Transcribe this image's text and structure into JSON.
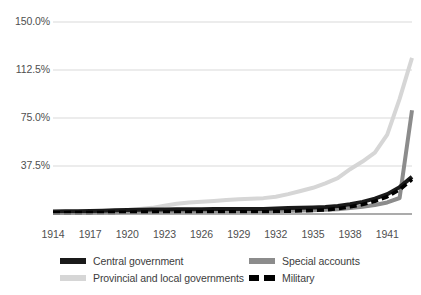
{
  "chart_data": {
    "type": "line",
    "title": "",
    "subtitle": "",
    "xlabel": "",
    "ylabel": "",
    "xlim": [
      1914,
      1943
    ],
    "ylim": [
      0,
      150
    ],
    "grid": true,
    "legend_position": "bottom",
    "y_ticks": [
      "150.0%",
      "112.5%",
      "75.0%",
      "37.5%"
    ],
    "y_tick_values": [
      150.0,
      112.5,
      75.0,
      37.5
    ],
    "x_ticks": [
      "1914",
      "1917",
      "1920",
      "1923",
      "1926",
      "1929",
      "1932",
      "1935",
      "1938",
      "1941"
    ],
    "x_tick_values": [
      1914,
      1917,
      1920,
      1923,
      1926,
      1929,
      1932,
      1935,
      1938,
      1941
    ],
    "x": [
      1914,
      1915,
      1916,
      1917,
      1918,
      1919,
      1920,
      1921,
      1922,
      1923,
      1924,
      1925,
      1926,
      1927,
      1928,
      1929,
      1930,
      1931,
      1932,
      1933,
      1934,
      1935,
      1936,
      1937,
      1938,
      1939,
      1940,
      1941,
      1942,
      1943
    ],
    "series": [
      {
        "name": "Central government",
        "color": "#1a1a1a",
        "style": "solid",
        "values": [
          2.0,
          2.1,
          2.2,
          2.4,
          2.6,
          2.9,
          3.2,
          3.4,
          3.5,
          3.6,
          3.7,
          3.7,
          3.8,
          3.9,
          4.0,
          4.0,
          3.9,
          3.9,
          4.2,
          4.6,
          4.8,
          5.0,
          5.4,
          6.2,
          7.6,
          9.5,
          12.0,
          15.5,
          21.0,
          29.0
        ]
      },
      {
        "name": "Special accounts",
        "color": "#8c8c8c",
        "style": "solid",
        "values": [
          1.0,
          1.0,
          1.1,
          1.2,
          1.3,
          1.4,
          1.6,
          1.7,
          1.8,
          1.9,
          1.9,
          2.0,
          2.0,
          2.1,
          2.1,
          2.2,
          2.2,
          2.2,
          2.4,
          2.6,
          2.8,
          3.0,
          3.3,
          3.8,
          4.6,
          5.6,
          7.0,
          9.0,
          12.5,
          81.0
        ]
      },
      {
        "name": "Provincial and local governments",
        "color": "#d6d6d6",
        "style": "solid",
        "values": [
          1.5,
          1.6,
          1.7,
          1.9,
          2.2,
          2.6,
          3.2,
          4.0,
          4.8,
          6.5,
          8.0,
          9.0,
          9.6,
          10.2,
          11.0,
          11.6,
          12.0,
          12.4,
          13.5,
          15.5,
          18.0,
          20.5,
          24.0,
          28.0,
          35.0,
          41.0,
          48.0,
          62.0,
          90.0,
          122.0
        ]
      },
      {
        "name": "Military",
        "color": "#000000",
        "style": "dashed",
        "values": [
          1.0,
          1.0,
          1.1,
          1.1,
          1.2,
          1.3,
          1.4,
          1.5,
          1.5,
          1.6,
          1.6,
          1.6,
          1.7,
          1.7,
          1.7,
          1.7,
          1.7,
          1.7,
          1.9,
          2.2,
          2.5,
          2.8,
          3.2,
          4.2,
          5.6,
          7.4,
          10.0,
          13.5,
          19.0,
          27.0
        ]
      }
    ]
  },
  "legend": {
    "items": [
      {
        "label": "Central government",
        "color": "#1a1a1a",
        "style": "solid"
      },
      {
        "label": "Special accounts",
        "color": "#8c8c8c",
        "style": "solid"
      },
      {
        "label": "Provincial and local governments",
        "color": "#d6d6d6",
        "style": "solid"
      },
      {
        "label": "Military",
        "color": "#000000",
        "style": "dashed"
      }
    ]
  },
  "colors": {
    "grid": "#d9d9d9",
    "axis": "#8f8f8f",
    "text": "#4f4f4f",
    "background": "#ffffff"
  }
}
